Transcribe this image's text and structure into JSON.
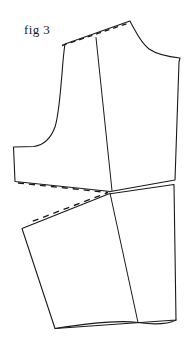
{
  "figure": {
    "caption": "fig 3",
    "kind": "sewing-pattern-draft",
    "background_color": "#ffffff",
    "line_color": "#1a1a1a",
    "dashed_line_color": "#1a1a1a",
    "solid_stroke_width": 1.1,
    "dashed_stroke_width": 1.3,
    "dash_pattern": "5 4",
    "canvas": {
      "width": 189,
      "height": 353
    }
  },
  "parts": {
    "bodice": {
      "name": "bodice-block",
      "outline_path": "M 65,44 L 130,21 L 131.5,24 C 137,34 141,43 149,49 C 158,55 170,57 180,58 L 179,62 L 175,180 L 110.5,191.5 L 15,181.5 L 13.5,147 L 34,146.5 C 44,145 51,138 55,127 C 59,114 60,95 62,74 C 63,60 64,50 65,44 Z"
    },
    "bodice_interior_seam": {
      "name": "center-front-seam",
      "path": "M 96,37.5 L 112,190.5"
    },
    "skirt": {
      "name": "skirt-panel",
      "outline_path": "M 22,228.5 L 108.5,194 L 174,184.5 L 176,320 L 55,328.5 Z"
    },
    "skirt_interior_seam": {
      "name": "skirt-center-seam",
      "path": "M 110,193 L 138,322.5"
    },
    "hem": {
      "name": "hem-line",
      "path": "M 55,328.5 C 95,322 120,320 138,322.5 C 155,325 168,324 176,320"
    },
    "dashed_shoulder": {
      "name": "pivoted-shoulder-guide",
      "path": "M 62,45.5 L 129,23"
    },
    "dashed_dart": {
      "name": "dart-closure-guide",
      "path": "M 18,183 L 108,192.5 L 28,223"
    }
  },
  "labels": {
    "caption_text": "fig 3"
  }
}
